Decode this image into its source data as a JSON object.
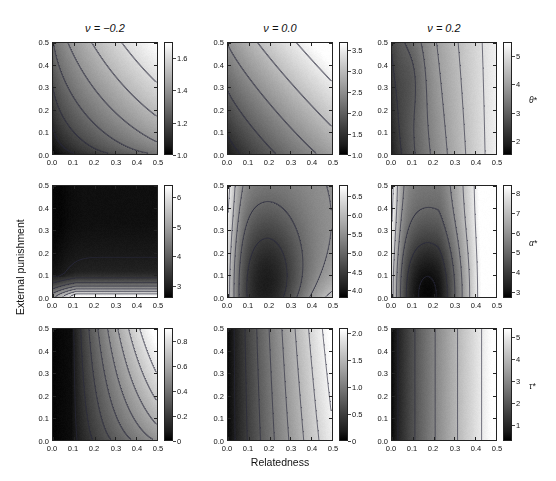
{
  "figure": {
    "xlabel": "Relatedness",
    "ylabel": "External punishment",
    "column_titles": [
      "ν = −0.2",
      "ν = 0.0",
      "ν = 0.2"
    ],
    "axis_ticks": [
      "0.0",
      "0.1",
      "0.2",
      "0.3",
      "0.4",
      "0.5"
    ],
    "axis_tick_values": [
      0.0,
      0.1,
      0.2,
      0.3,
      0.4,
      0.5
    ],
    "row_labels": [
      "θ*",
      "α*",
      "τ*"
    ],
    "colormap": "gray"
  },
  "chart_data": [
    {
      "type": "heatmap",
      "title": "ν = −0.2",
      "row": 1,
      "col": 1,
      "row_variable": "θ*",
      "xlabel": "Relatedness",
      "ylabel": "External punishment",
      "xlim": [
        0.0,
        0.5
      ],
      "ylim": [
        0.0,
        0.5
      ],
      "xticks": [
        0.0,
        0.1,
        0.2,
        0.3,
        0.4,
        0.5
      ],
      "yticks": [
        0.0,
        0.1,
        0.2,
        0.3,
        0.4,
        0.5
      ],
      "zlim": [
        1.0,
        1.7
      ],
      "cbar_ticks": [
        "1.0",
        "1.2",
        "1.4",
        "1.6"
      ],
      "cbar_tick_values": [
        1.0,
        1.2,
        1.4,
        1.6
      ],
      "contour_levels": [
        1.1,
        1.2,
        1.3,
        1.4,
        1.5,
        1.6
      ],
      "grid": false,
      "legend": false,
      "description": "Value increases from dark at lower-left (≈1.0) to light at upper-right (≈1.7); contours curve convexly toward the origin."
    },
    {
      "type": "heatmap",
      "title": "ν = 0.0",
      "row": 1,
      "col": 2,
      "row_variable": "θ*",
      "xlabel": "Relatedness",
      "ylabel": "External punishment",
      "xlim": [
        0.0,
        0.5
      ],
      "ylim": [
        0.0,
        0.5
      ],
      "xticks": [
        0.0,
        0.1,
        0.2,
        0.3,
        0.4,
        0.5
      ],
      "yticks": [
        0.0,
        0.1,
        0.2,
        0.3,
        0.4,
        0.5
      ],
      "zlim": [
        1.0,
        3.7
      ],
      "cbar_ticks": [
        "1.0",
        "1.5",
        "2.0",
        "2.5",
        "3.0",
        "3.5"
      ],
      "cbar_tick_values": [
        1.0,
        1.5,
        2.0,
        2.5,
        3.0,
        3.5
      ],
      "contour_levels": [
        1.5,
        2.0,
        2.5,
        3.0,
        3.5
      ],
      "grid": false,
      "legend": false,
      "description": "Near-linear diagonal contours; dark at lower-left, light at upper-right."
    },
    {
      "type": "heatmap",
      "title": "ν = 0.2",
      "row": 1,
      "col": 3,
      "row_variable": "θ*",
      "xlabel": "Relatedness",
      "ylabel": "External punishment",
      "xlim": [
        0.0,
        0.5
      ],
      "ylim": [
        0.0,
        0.5
      ],
      "xticks": [
        0.0,
        0.1,
        0.2,
        0.3,
        0.4,
        0.5
      ],
      "yticks": [
        0.0,
        0.1,
        0.2,
        0.3,
        0.4,
        0.5
      ],
      "zlim": [
        1.5,
        5.5
      ],
      "cbar_ticks": [
        "2",
        "3",
        "4",
        "5"
      ],
      "cbar_tick_values": [
        2,
        3,
        4,
        5
      ],
      "contour_levels": [
        2,
        2.5,
        3,
        3.5,
        4,
        4.5,
        5
      ],
      "grid": false,
      "legend": false,
      "description": "Dark band along left edge with a local kink near relatedness 0.1; contours become steep vertical toward the right."
    },
    {
      "type": "heatmap",
      "title": "ν = −0.2",
      "row": 2,
      "col": 1,
      "row_variable": "α*",
      "xlabel": "Relatedness",
      "ylabel": "External punishment",
      "xlim": [
        0.0,
        0.5
      ],
      "ylim": [
        0.0,
        0.5
      ],
      "xticks": [
        0.0,
        0.1,
        0.2,
        0.3,
        0.4,
        0.5
      ],
      "yticks": [
        0.0,
        0.1,
        0.2,
        0.3,
        0.4,
        0.5
      ],
      "zlim": [
        2.6,
        6.4
      ],
      "cbar_ticks": [
        "3",
        "4",
        "5",
        "6"
      ],
      "cbar_tick_values": [
        3,
        4,
        5,
        6
      ],
      "contour_levels": [
        3,
        3.5,
        4,
        4.5,
        5,
        5.5,
        6
      ],
      "grid": false,
      "legend": false,
      "description": "Bright horizontal band hugging the bottom edge; most of the panel is dark, value decreases upward."
    },
    {
      "type": "heatmap",
      "title": "ν = 0.0",
      "row": 2,
      "col": 2,
      "row_variable": "α*",
      "xlabel": "Relatedness",
      "ylabel": "External punishment",
      "xlim": [
        0.0,
        0.5
      ],
      "ylim": [
        0.0,
        0.5
      ],
      "xticks": [
        0.0,
        0.1,
        0.2,
        0.3,
        0.4,
        0.5
      ],
      "yticks": [
        0.0,
        0.1,
        0.2,
        0.3,
        0.4,
        0.5
      ],
      "zlim": [
        3.8,
        6.8
      ],
      "cbar_ticks": [
        "4.0",
        "4.5",
        "5.0",
        "5.5",
        "6.0",
        "6.5"
      ],
      "cbar_tick_values": [
        4.0,
        4.5,
        5.0,
        5.5,
        6.0,
        6.5
      ],
      "contour_levels": [
        4.5,
        5.0,
        5.5,
        6.0,
        6.5
      ],
      "grid": false,
      "legend": false,
      "description": "Dark dome-shaped region peaking near relatedness 0.2; brighter at the left edge and lower-right corner."
    },
    {
      "type": "heatmap",
      "title": "ν = 0.2",
      "row": 2,
      "col": 3,
      "row_variable": "α*",
      "xlabel": "Relatedness",
      "ylabel": "External punishment",
      "xlim": [
        0.0,
        0.5
      ],
      "ylim": [
        0.0,
        0.5
      ],
      "xticks": [
        0.0,
        0.1,
        0.2,
        0.3,
        0.4,
        0.5
      ],
      "yticks": [
        0.0,
        0.1,
        0.2,
        0.3,
        0.4,
        0.5
      ],
      "zlim": [
        2.7,
        8.4
      ],
      "cbar_ticks": [
        "3",
        "4",
        "5",
        "6",
        "7",
        "8"
      ],
      "cbar_tick_values": [
        3,
        4,
        5,
        6,
        7,
        8
      ],
      "contour_levels": [
        3,
        4,
        5,
        6,
        7,
        8
      ],
      "grid": false,
      "legend": false,
      "description": "Nested dark arches rising from the lower-left, peaking around relatedness 0.15–0.2; bright at left edge and right side."
    },
    {
      "type": "heatmap",
      "title": "ν = −0.2",
      "row": 3,
      "col": 1,
      "row_variable": "τ*",
      "xlabel": "Relatedness",
      "ylabel": "External punishment",
      "xlim": [
        0.0,
        0.5
      ],
      "ylim": [
        0.0,
        0.5
      ],
      "xticks": [
        0.0,
        0.1,
        0.2,
        0.3,
        0.4,
        0.5
      ],
      "yticks": [
        0.0,
        0.1,
        0.2,
        0.3,
        0.4,
        0.5
      ],
      "zlim": [
        0.0,
        0.9
      ],
      "cbar_ticks": [
        "0",
        "0.2",
        "0.4",
        "0.6",
        "0.8"
      ],
      "cbar_tick_values": [
        0,
        0.2,
        0.4,
        0.6,
        0.8
      ],
      "contour_levels": [
        0.1,
        0.2,
        0.3,
        0.4,
        0.5,
        0.6,
        0.7,
        0.8
      ],
      "grid": false,
      "legend": false,
      "description": "Black along the left edge up to relatedness ≈0.1, then rising steeply; brightest at the upper-right corner."
    },
    {
      "type": "heatmap",
      "title": "ν = 0.0",
      "row": 3,
      "col": 2,
      "row_variable": "τ*",
      "xlabel": "Relatedness",
      "ylabel": "External punishment",
      "xlim": [
        0.0,
        0.5
      ],
      "ylim": [
        0.0,
        0.5
      ],
      "xticks": [
        0.0,
        0.1,
        0.2,
        0.3,
        0.4,
        0.5
      ],
      "yticks": [
        0.0,
        0.1,
        0.2,
        0.3,
        0.4,
        0.5
      ],
      "zlim": [
        0.0,
        2.1
      ],
      "cbar_ticks": [
        "0",
        "0.5",
        "1.0",
        "1.5",
        "2.0"
      ],
      "cbar_tick_values": [
        0,
        0.5,
        1.0,
        1.5,
        2.0
      ],
      "contour_levels": [
        0.25,
        0.5,
        0.75,
        1.0,
        1.25,
        1.5,
        1.75,
        2.0
      ],
      "grid": false,
      "legend": false,
      "description": "Nearly vertical contours; dark on the left, steadily brighter toward the right edge."
    },
    {
      "type": "heatmap",
      "title": "ν = 0.2",
      "row": 3,
      "col": 3,
      "row_variable": "τ*",
      "xlabel": "Relatedness",
      "ylabel": "External punishment",
      "xlim": [
        0.0,
        0.5
      ],
      "ylim": [
        0.0,
        0.5
      ],
      "xticks": [
        0.0,
        0.1,
        0.2,
        0.3,
        0.4,
        0.5
      ],
      "yticks": [
        0.0,
        0.1,
        0.2,
        0.3,
        0.4,
        0.5
      ],
      "zlim": [
        0.3,
        5.4
      ],
      "cbar_ticks": [
        "1",
        "2",
        "3",
        "4",
        "5"
      ],
      "cbar_tick_values": [
        1,
        2,
        3,
        4,
        5
      ],
      "contour_levels": [
        1,
        2,
        3,
        4,
        5
      ],
      "grid": false,
      "legend": false,
      "description": "Strictly vertical contours independent of external punishment; dark on the left, bright on the right."
    }
  ]
}
